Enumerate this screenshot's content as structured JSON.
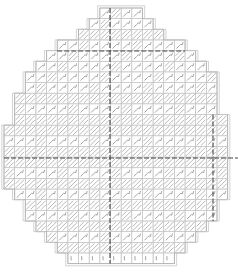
{
  "pattern": {
    "title": "Egg needlepoint stitch chart",
    "shape": "egg",
    "grid": {
      "cell_size": 10.65,
      "origin_x": 4,
      "origin_y": 8,
      "columns": 22,
      "rows": 24
    },
    "center_lines": {
      "vertical_x": 110,
      "horizontal_y": 158,
      "top_horizontal_y": 51,
      "right_vertical_x": 213
    },
    "colors": {
      "grid": "#c4c4c4",
      "outline": "#b0b0b0",
      "stitch": "#9a9a9a",
      "center": "#444444",
      "background": "#ffffff"
    },
    "rows": [
      {
        "start": 9,
        "end": 13,
        "style": "loop"
      },
      {
        "start": 8,
        "end": 14,
        "style": "loop"
      },
      {
        "start": 7,
        "end": 15,
        "style": "diag"
      },
      {
        "start": 5,
        "end": 17,
        "style": "loop"
      },
      {
        "start": 4,
        "end": 18,
        "style": "loop"
      },
      {
        "start": 3,
        "end": 19,
        "style": "loop"
      },
      {
        "start": 2,
        "end": 20,
        "style": "loop"
      },
      {
        "start": 2,
        "end": 20,
        "style": "loop"
      },
      {
        "start": 1,
        "end": 20,
        "style": "diag"
      },
      {
        "start": 1,
        "end": 20,
        "style": "loop"
      },
      {
        "start": 1,
        "end": 21,
        "style": "diag"
      },
      {
        "start": 0,
        "end": 21,
        "style": "diag"
      },
      {
        "start": 0,
        "end": 21,
        "style": "loop"
      },
      {
        "start": 0,
        "end": 21,
        "style": "diag"
      },
      {
        "start": 0,
        "end": 21,
        "style": "diag"
      },
      {
        "start": 0,
        "end": 21,
        "style": "loop"
      },
      {
        "start": 0,
        "end": 21,
        "style": "diag"
      },
      {
        "start": 1,
        "end": 21,
        "style": "loop"
      },
      {
        "start": 2,
        "end": 20,
        "style": "diag"
      },
      {
        "start": 2,
        "end": 20,
        "style": "loop"
      },
      {
        "start": 3,
        "end": 19,
        "style": "diag"
      },
      {
        "start": 4,
        "end": 18,
        "style": "loop"
      },
      {
        "start": 5,
        "end": 17,
        "style": "diag"
      },
      {
        "start": 6,
        "end": 16,
        "style": "plain"
      }
    ]
  }
}
